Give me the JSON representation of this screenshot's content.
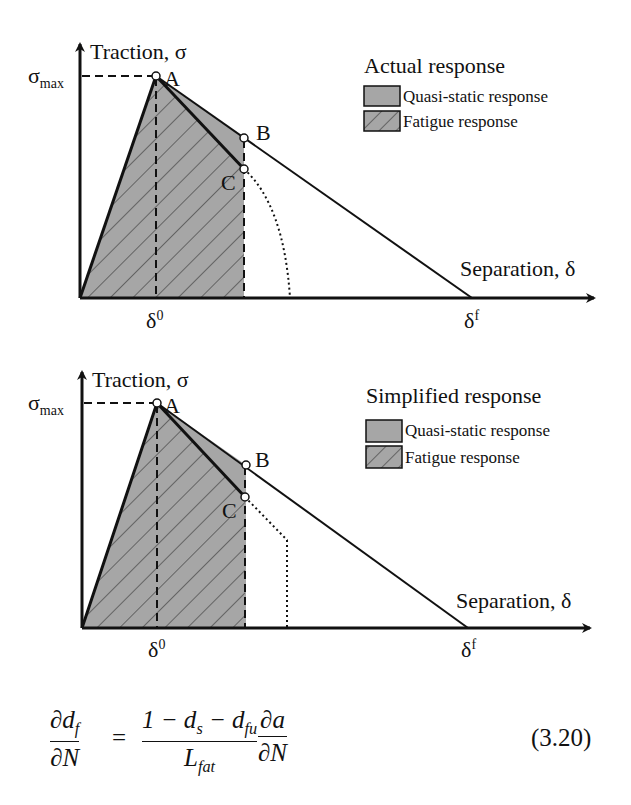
{
  "figure": {
    "panels": [
      {
        "id": "actual",
        "legend_title": "Actual response",
        "legend_items": [
          {
            "label": "Quasi-static response",
            "fill": "solid-gray"
          },
          {
            "label": "Fatigue response",
            "fill": "hatched-gray"
          }
        ],
        "y_axis_label": "Traction, σ",
        "x_axis_label": "Separation, δ",
        "y_tick_label": "σ",
        "y_tick_sub": "max",
        "x_tick_0": "δ",
        "x_tick_0_sup": "0",
        "x_tick_f": "δ",
        "x_tick_f_sup": "f",
        "points": {
          "A": "A",
          "B": "B",
          "C": "C"
        },
        "degradation_curve": "dotted-arc"
      },
      {
        "id": "simplified",
        "legend_title": "Simplified response",
        "legend_items": [
          {
            "label": "Quasi-static response",
            "fill": "solid-gray"
          },
          {
            "label": "Fatigue response",
            "fill": "hatched-gray"
          }
        ],
        "y_axis_label": "Traction, σ",
        "x_axis_label": "Separation, δ",
        "y_tick_label": "σ",
        "y_tick_sub": "max",
        "x_tick_0": "δ",
        "x_tick_0_sup": "0",
        "x_tick_f": "δ",
        "x_tick_f_sup": "f",
        "points": {
          "A": "A",
          "B": "B",
          "C": "C"
        },
        "degradation_curve": "dotted-polyline"
      }
    ],
    "colors": {
      "fill": "#a6a6a6",
      "line": "#111111",
      "background": "#ffffff"
    }
  },
  "equation": {
    "lhs_num_d": "∂d",
    "lhs_num_sub": "f",
    "lhs_den": "∂N",
    "equals": "=",
    "rhs_num_1": "1 − d",
    "rhs_num_sub1": "s",
    "rhs_num_2": " − d",
    "rhs_num_sub2": "fu",
    "rhs_den": "L",
    "rhs_den_sub": "fat",
    "rhs2_num": "∂a",
    "rhs2_den": "∂N",
    "number": "(3.20)"
  }
}
